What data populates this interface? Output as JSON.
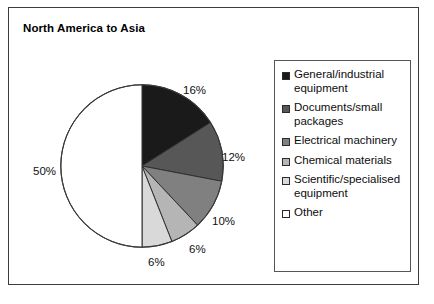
{
  "chart_data": {
    "type": "pie",
    "title": "North America to Asia",
    "categories": [
      "General/industrial equipment",
      "Documents/small packages",
      "Electrical machinery",
      "Chemical materials",
      "Scientific/specialised equipment",
      "Other"
    ],
    "values": [
      16,
      12,
      10,
      6,
      6,
      50
    ],
    "value_labels": [
      "16%",
      "12%",
      "10%",
      "6%",
      "6%",
      "50%"
    ],
    "unit": "%",
    "colors": [
      "#1a1a1a",
      "#575757",
      "#808080",
      "#b5b5b5",
      "#d9d9d9",
      "#ffffff"
    ],
    "start_angle_deg": 0,
    "direction": "clockwise",
    "legend_position": "right",
    "grid": false,
    "xlabel": "",
    "ylabel": ""
  },
  "legend": {
    "entries": [
      {
        "label": "General/industrial equipment",
        "color": "#1a1a1a"
      },
      {
        "label": "Documents/small packages",
        "color": "#575757"
      },
      {
        "label": "Electrical machinery",
        "color": "#808080"
      },
      {
        "label": "Chemical materials",
        "color": "#b5b5b5"
      },
      {
        "label": "Scientific/specialised equipment",
        "color": "#d9d9d9"
      },
      {
        "label": "Other",
        "color": "#ffffff"
      }
    ]
  },
  "slice_labels": [
    {
      "text": "16%",
      "left": 183,
      "top": 84
    },
    {
      "text": "12%",
      "left": 222,
      "top": 151
    },
    {
      "text": "10%",
      "left": 212,
      "top": 215
    },
    {
      "text": "6%",
      "left": 189,
      "top": 243
    },
    {
      "text": "6%",
      "left": 148,
      "top": 256
    },
    {
      "text": "50%",
      "left": 33,
      "top": 165
    }
  ]
}
